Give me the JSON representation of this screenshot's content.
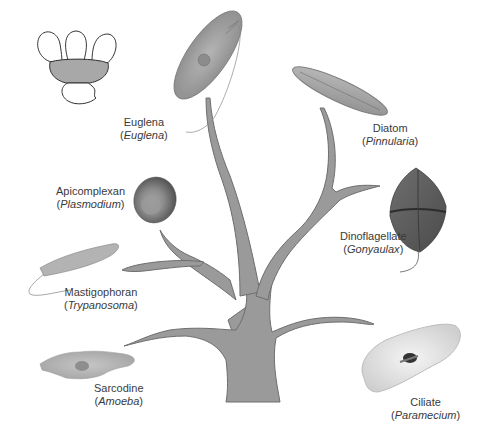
{
  "diagram": {
    "type": "phylogenetic-tree",
    "colors": {
      "branch_fill": "#9a9a9a",
      "branch_stroke": "#6e6e6e",
      "label_text": "#3a3a3a",
      "background": "#ffffff"
    },
    "icon": {
      "name": "protist-group-outline",
      "lobe_count": 3,
      "fill": "#a8a8a8"
    },
    "organisms": [
      {
        "id": "euglena",
        "common": "Euglena",
        "genus": "Euglena"
      },
      {
        "id": "diatom",
        "common": "Diatom",
        "genus": "Pinnularia"
      },
      {
        "id": "apicomplexan",
        "common": "Apicomplexan",
        "genus": "Plasmodium"
      },
      {
        "id": "dinoflagellate",
        "common": "Dinoflagellate",
        "genus": "Gonyaulax"
      },
      {
        "id": "mastigophoran",
        "common": "Mastigophoran",
        "genus": "Trypanosoma"
      },
      {
        "id": "sarcodine",
        "common": "Sarcodine",
        "genus": "Amoeba"
      },
      {
        "id": "ciliate",
        "common": "Ciliate",
        "genus": "Paramecium"
      }
    ]
  }
}
